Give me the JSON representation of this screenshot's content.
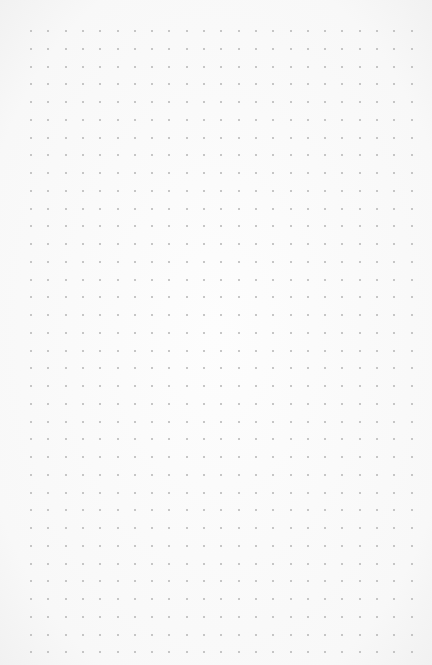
{
  "page": {
    "type": "dot-grid paper",
    "background_color": "#f9f9f9",
    "dot_color": "#b4b4b4"
  },
  "grid": {
    "origin_x": 31,
    "origin_y": 31,
    "spacing_x": 17.3,
    "spacing_y": 17.75,
    "columns": 23,
    "rows": 36
  }
}
